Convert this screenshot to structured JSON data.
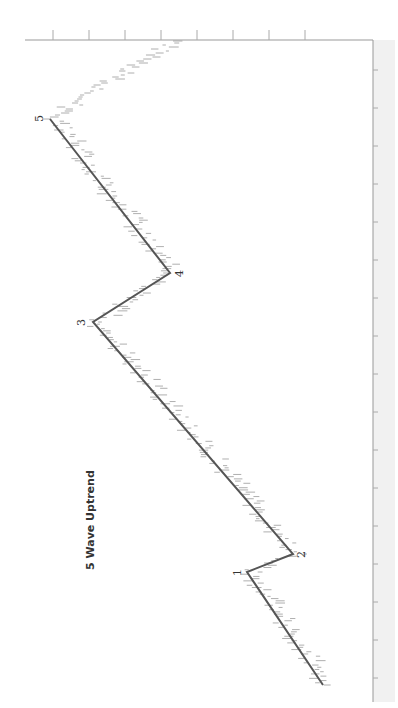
{
  "chart_data": {
    "type": "line",
    "title": "5 Wave Uptrend",
    "orientation": "rotated 90° (time runs bottom-to-top along right axis, price increases to the left)",
    "wave_points": [
      {
        "label": "0",
        "x": 323,
        "y": 685
      },
      {
        "label": "1",
        "x": 247,
        "y": 572
      },
      {
        "label": "2",
        "x": 293,
        "y": 554
      },
      {
        "label": "3",
        "x": 93,
        "y": 322
      },
      {
        "label": "4",
        "x": 170,
        "y": 273
      },
      {
        "label": "5",
        "x": 50,
        "y": 119
      }
    ],
    "wave_labels": [
      "1",
      "2",
      "3",
      "4",
      "5"
    ],
    "xlabel": "",
    "ylabel": "",
    "grid": false,
    "legend": "none"
  },
  "colors": {
    "wave_line": "#555555",
    "price_bars": "#9a9a9a",
    "axis": "#888888",
    "background": "#ffffff"
  }
}
